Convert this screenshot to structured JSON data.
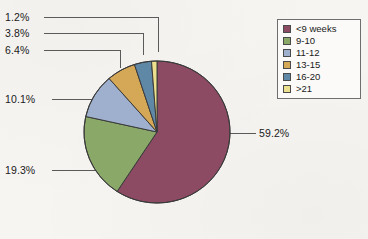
{
  "chart_data": {
    "type": "pie",
    "title": "",
    "xlabel": "",
    "ylabel": "",
    "categories": [
      "<9 weeks",
      "9-10",
      "11-12",
      "13-15",
      "16-20",
      ">21"
    ],
    "values": [
      59.2,
      19.3,
      10.1,
      6.4,
      3.8,
      1.2
    ],
    "value_labels": [
      "59.2%",
      "19.3%",
      "10.1%",
      "6.4%",
      "3.8%",
      "1.2%"
    ],
    "units": "percent",
    "legend_position": "top-right",
    "grid": false,
    "start_angle_deg": 0,
    "direction": "clockwise",
    "colors": [
      "#8c4a63",
      "#8aa868",
      "#9fb0cf",
      "#d4a857",
      "#5f87a6",
      "#ecdf8e"
    ],
    "slices": [
      {
        "label": "<9 weeks",
        "value": 59.2,
        "value_label": "59.2%",
        "color": "#8c4a63"
      },
      {
        "label": "9-10",
        "value": 19.3,
        "value_label": "19.3%",
        "color": "#8aa868"
      },
      {
        "label": "11-12",
        "value": 10.1,
        "value_label": "10.1%",
        "color": "#9fb0cf"
      },
      {
        "label": "13-15",
        "value": 6.4,
        "value_label": "6.4%",
        "color": "#d4a857"
      },
      {
        "label": "16-20",
        "value": 3.8,
        "value_label": "3.8%",
        "color": "#5f87a6"
      },
      {
        "label": ">21",
        "value": 1.2,
        "value_label": "1.2%",
        "color": "#ecdf8e"
      }
    ]
  },
  "legend": {
    "items": [
      {
        "label": "<9 weeks",
        "color": "#8c4a63"
      },
      {
        "label": "9-10",
        "color": "#8aa868"
      },
      {
        "label": "11-12",
        "color": "#9fb0cf"
      },
      {
        "label": "13-15",
        "color": "#d4a857"
      },
      {
        "label": "16-20",
        "color": "#5f87a6"
      },
      {
        "label": ">21",
        "color": "#ecdf8e"
      }
    ]
  },
  "labels": {
    "l_1_2": "1.2%",
    "l_3_8": "3.8%",
    "l_6_4": "6.4%",
    "l_10_1": "10.1%",
    "l_19_3": "19.3%",
    "l_59_2": "59.2%"
  },
  "style": {
    "outline": "#3a3a3a",
    "leader": "#5a5a5a",
    "background": "#f7f5f2"
  }
}
